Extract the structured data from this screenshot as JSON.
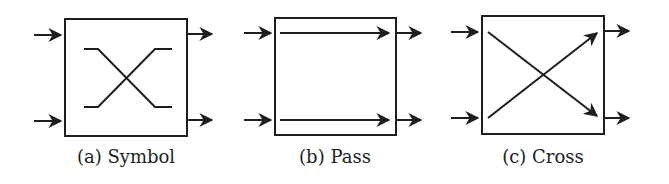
{
  "figure": {
    "colors": {
      "stroke": "#1e1e1e",
      "background": "#ffffff"
    },
    "panels": [
      {
        "id": "a",
        "caption": "(a) Symbol",
        "type": "symbol"
      },
      {
        "id": "b",
        "caption": "(b) Pass",
        "type": "pass"
      },
      {
        "id": "c",
        "caption": "(c) Cross",
        "type": "cross"
      }
    ]
  }
}
